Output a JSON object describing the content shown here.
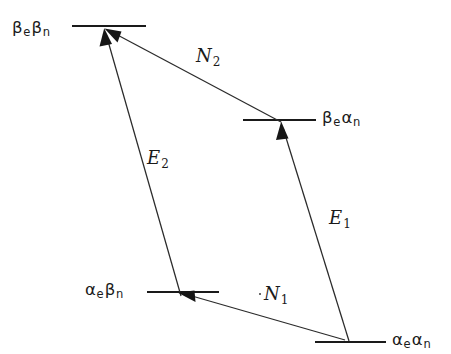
{
  "diagram": {
    "background_color": "#ffffff",
    "line_color": "#1a1a1a",
    "width": 451,
    "height": 354,
    "levels": [
      {
        "id": "beta-e-beta-n",
        "label_main_1": "β",
        "label_sub_1": "e",
        "label_main_2": "β",
        "label_sub_2": "n",
        "label_text": "βeβn",
        "label_side": "left",
        "label_x": 12,
        "label_y": 20,
        "line_x1": 72,
        "line_x2": 146,
        "line_y": 26
      },
      {
        "id": "beta-e-alpha-n",
        "label_main_1": "β",
        "label_sub_1": "e",
        "label_main_2": "α",
        "label_sub_2": "n",
        "label_text": "βeαn",
        "label_side": "right",
        "label_x": 322,
        "label_y": 110,
        "line_x1": 243,
        "line_x2": 316,
        "line_y": 120
      },
      {
        "id": "alpha-e-beta-n",
        "label_main_1": "α",
        "label_sub_1": "e",
        "label_main_2": "β",
        "label_sub_2": "n",
        "label_text": "αeβn",
        "label_side": "left",
        "label_x": 85,
        "label_y": 282,
        "line_x1": 147,
        "line_x2": 219,
        "line_y": 292
      },
      {
        "id": "alpha-e-alpha-n",
        "label_main_1": "α",
        "label_sub_1": "e",
        "label_main_2": "α",
        "label_sub_2": "n",
        "label_text": "αeαn",
        "label_side": "right",
        "label_x": 392,
        "label_y": 332,
        "line_x1": 315,
        "line_x2": 386,
        "line_y": 342
      }
    ],
    "transitions": [
      {
        "id": "n2",
        "label_main": "N",
        "label_sub": "2",
        "label_text": "N2",
        "label_x": 196,
        "label_y": 47,
        "from_level": "beta-e-alpha-n",
        "to_level": "beta-e-beta-n",
        "x1": 281,
        "y1": 122,
        "x2": 106,
        "y2": 29,
        "arrow_at": "end",
        "arrow_angle_deg": 208
      },
      {
        "id": "e2",
        "label_main": "E",
        "label_sub": "2",
        "label_text": "E2",
        "label_x": 147,
        "label_y": 149,
        "from_level": "alpha-e-beta-n",
        "to_level": "beta-e-beta-n",
        "x1": 181,
        "y1": 296,
        "x2": 104,
        "y2": 30,
        "arrow_at": "end",
        "arrow_angle_deg": 254
      },
      {
        "id": "e1",
        "label_main": "E",
        "label_sub": "1",
        "label_text": "E1",
        "label_x": 329,
        "label_y": 209,
        "from_level": "alpha-e-alpha-n",
        "to_level": "beta-e-alpha-n",
        "x1": 349,
        "y1": 341,
        "x2": 281,
        "y2": 123,
        "arrow_at": "end",
        "arrow_angle_deg": 287
      },
      {
        "id": "n1",
        "label_main": "N",
        "label_sub": "1",
        "label_text": "N1",
        "label_x": 262,
        "label_y": 285,
        "from_level": "alpha-e-alpha-n",
        "to_level": "alpha-e-beta-n",
        "x1": 345,
        "y1": 340,
        "x2": 180,
        "y2": 293,
        "arrow_at": "end",
        "arrow_angle_deg": 196
      }
    ]
  }
}
